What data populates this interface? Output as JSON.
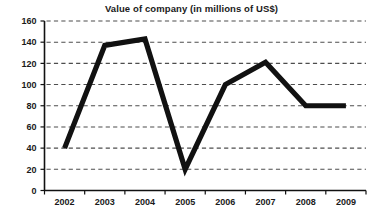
{
  "chart_data": {
    "type": "line",
    "title": "Value of company (in millions of US$)",
    "xlabel": "",
    "ylabel": "",
    "categories": [
      "2002",
      "2003",
      "2004",
      "2005",
      "2006",
      "2007",
      "2008",
      "2009"
    ],
    "values": [
      40,
      137,
      143,
      20,
      100,
      121,
      80,
      80
    ],
    "series": [
      {
        "name": "Value of company",
        "values": [
          40,
          137,
          143,
          20,
          100,
          121,
          80,
          80
        ]
      }
    ],
    "ylim": [
      0,
      160
    ],
    "ytick_labels": [
      "0",
      "20",
      "40",
      "60",
      "80",
      "100",
      "120",
      "140",
      "160"
    ],
    "ytick_values": [
      0,
      20,
      40,
      60,
      80,
      100,
      120,
      140,
      160
    ],
    "xtick_labels": [
      "2002",
      "2003",
      "2004",
      "2005",
      "2006",
      "2007",
      "2008",
      "2009"
    ],
    "grid": true,
    "grid_axis": "y",
    "grid_style": "dashed",
    "legend": false,
    "legend_position": "none",
    "line_color": "#111111",
    "grid_color": "#4d4d4d",
    "axis_color": "#111111",
    "background_color": "#ffffff",
    "text_color": "#1a1a1a"
  }
}
